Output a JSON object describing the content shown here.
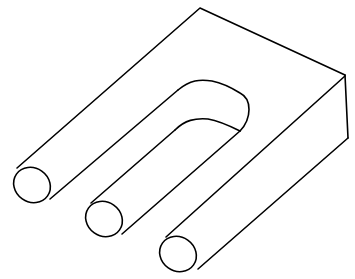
{
  "figure": {
    "stroke_color": "#000000",
    "background": "#ffffff"
  }
}
